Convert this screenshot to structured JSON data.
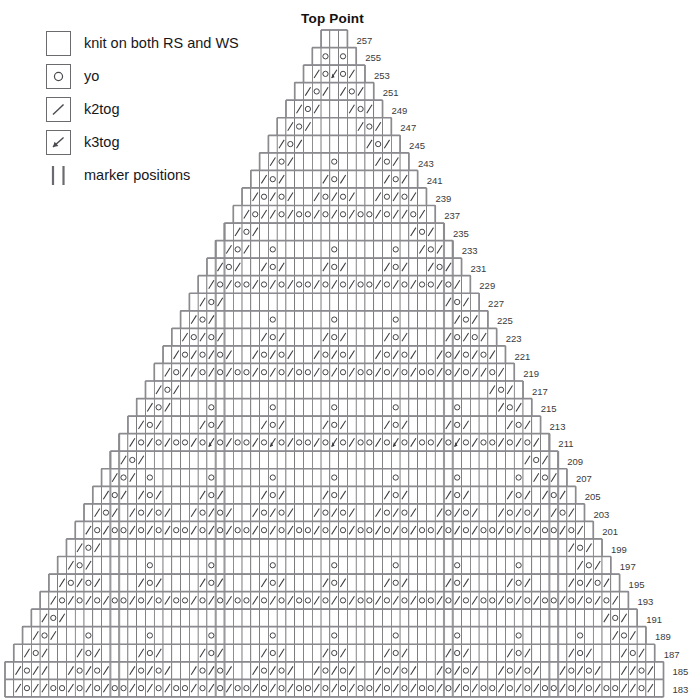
{
  "title": "Top Point",
  "legend": {
    "items": [
      {
        "icon": "empty-square-icon",
        "symbol": "none",
        "label": "knit on both RS and WS"
      },
      {
        "icon": "circle-icon",
        "symbol": "yo",
        "label": "yo"
      },
      {
        "icon": "slash-icon",
        "symbol": "k2tog",
        "label": "k2tog"
      },
      {
        "icon": "arrow-slash-icon",
        "symbol": "k3tog",
        "label": "k3tog"
      },
      {
        "icon": "double-bar-icon",
        "symbol": "marker",
        "label": "marker positions"
      }
    ]
  },
  "chart_data": {
    "type": "table",
    "title": "Top Point",
    "row_numbers": [
      257,
      255,
      253,
      251,
      249,
      247,
      245,
      243,
      241,
      239,
      237,
      235,
      233,
      231,
      229,
      227,
      225,
      223,
      221,
      219,
      217,
      215,
      213,
      211,
      209,
      207,
      205,
      203,
      201,
      199,
      197,
      195,
      193,
      191,
      189,
      187,
      185,
      183
    ],
    "row_count": 38,
    "columns_bottom": 75,
    "columns_top": 3,
    "cell_px": 8.78,
    "row_px": 17.55,
    "marker_columns": [
      12,
      24,
      50,
      62
    ],
    "grid_color": "#4a4a4e",
    "outline_color": "#8a8a8f",
    "marker_color": "#9b9b9f",
    "rows": [
      {
        "n": 257,
        "w": 3,
        "cells": "./."
      },
      {
        "n": 255,
        "w": 5,
        "cells": ".A o /."
      },
      {
        "n": 253,
        "w": 7,
        "cells": ". / o A o / ."
      },
      {
        "n": 251,
        "w": 9,
        "cells": ". / o / . / o / ."
      },
      {
        "n": 249,
        "w": 11,
        "cells": ". / o / . . . / o / ."
      },
      {
        "n": 247,
        "w": 13,
        "cells": ". / o / . . . . . / o / ."
      },
      {
        "n": 245,
        "w": 15,
        "cells": ". / o / . . . . . . . / o / ."
      },
      {
        "n": 243,
        "w": 17,
        "cells": ". / o / . . . o . . . / o / ."
      },
      {
        "n": 241,
        "w": 19,
        "cells": ". / o / . . / o / . . / o / ."
      },
      {
        "n": 239,
        "w": 21,
        "cells": ". / o / . / o / o / . / o / ."
      },
      {
        "n": 237,
        "w": 23,
        "cells": ". / o / o / o / o / o / o / ."
      },
      {
        "n": 235,
        "w": 25,
        "cells": ". / o / . . . . . . . / o / ."
      },
      {
        "n": 233,
        "w": 27,
        "cells": ". / o / . . . o . . . / o / ."
      },
      {
        "n": 231,
        "w": 29,
        "cells": ". / o / . . / o / . . / o / ."
      },
      {
        "n": 229,
        "w": 31,
        "cells": ". / o / o / o / o / o / o / ."
      },
      {
        "n": 227,
        "w": 33,
        "cells": ". / o / . . . . . . . / o / ."
      },
      {
        "n": 225,
        "w": 35,
        "cells": ". / o / . . . o . . . / o / ."
      },
      {
        "n": 223,
        "w": 37,
        "cells": ". / o / . . / o / . . / o / ."
      },
      {
        "n": 221,
        "w": 39,
        "cells": ". / o / . / o / o / . / o / ."
      },
      {
        "n": 219,
        "w": 41,
        "cells": ". / o / o / o / o / o / o / ."
      },
      {
        "n": 217,
        "w": 43,
        "cells": ". / o / . . . . . . . / o / ."
      },
      {
        "n": 215,
        "w": 45,
        "cells": ". / o / . . . o . . . / o / ."
      },
      {
        "n": 213,
        "w": 47,
        "cells": ". / o / . . / o / . . / o / ."
      },
      {
        "n": 211,
        "w": 49,
        "cells": ". / o / o / o A o / o / o / ."
      },
      {
        "n": 209,
        "w": 51,
        "cells": ". / o / . . . . . . . / o / ."
      },
      {
        "n": 207,
        "w": 53,
        "cells": ". / o / . . . o . . . / o / ."
      },
      {
        "n": 205,
        "w": 55,
        "cells": ". / o / . . / o / . . / o / ."
      },
      {
        "n": 203,
        "w": 57,
        "cells": ". / o / . / o / o / . / o / ."
      },
      {
        "n": 201,
        "w": 59,
        "cells": ". / o / o / o / o / o / o / ."
      },
      {
        "n": 199,
        "w": 61,
        "cells": ". / o / . . . . . . . / o / ."
      },
      {
        "n": 197,
        "w": 63,
        "cells": ". / o / . . . o . . . / o / ."
      },
      {
        "n": 195,
        "w": 65,
        "cells": ". / o / . . / o / . . / o / ."
      },
      {
        "n": 193,
        "w": 67,
        "cells": ". / o / o / o / o / o / o / ."
      },
      {
        "n": 191,
        "w": 69,
        "cells": ". / o / . . . . . . . / o / ."
      },
      {
        "n": 189,
        "w": 71,
        "cells": ". / o / . . . o . . . / o / ."
      },
      {
        "n": 187,
        "w": 73,
        "cells": ". / o / . . / o / . . / o / ."
      },
      {
        "n": 185,
        "w": 75,
        "cells": ". / o / . / o / o / . / o / ."
      },
      {
        "n": 183,
        "w": 75,
        "cells": ". / o / o / o / o / o / o / ."
      }
    ]
  }
}
